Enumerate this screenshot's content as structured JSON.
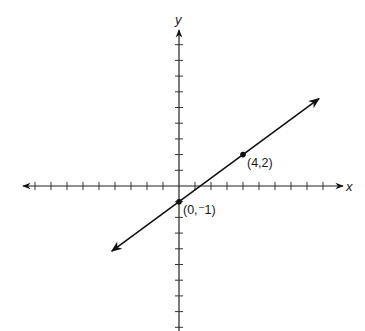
{
  "chart_data": {
    "type": "line",
    "title": "",
    "xlabel": "x",
    "ylabel": "y",
    "xlim": [
      -10,
      10.2
    ],
    "ylim": [
      -9.4,
      9.8
    ],
    "x_ticks": [
      -9,
      -8,
      -7,
      -6,
      -5,
      -4,
      -3,
      -2,
      -1,
      1,
      2,
      3,
      4,
      5,
      6,
      7,
      8,
      9
    ],
    "y_ticks": [
      -9,
      -8,
      -7,
      -6,
      -5,
      -4,
      -3,
      -2,
      -1,
      1,
      2,
      3,
      4,
      5,
      6,
      7,
      8,
      9
    ],
    "tick_labels_shown": false,
    "grid": false,
    "series": [
      {
        "name": "line",
        "equation": "y = 0.75x - 1",
        "slope": 0.75,
        "intercept": -1,
        "x_range": [
          -4.2,
          8.75
        ],
        "arrows_both_ends": true,
        "color": "#111111"
      }
    ],
    "points": [
      {
        "x": 0,
        "y": -1,
        "label": "(0,⁻1)"
      },
      {
        "x": 4,
        "y": 2,
        "label": "(4,2)"
      }
    ]
  }
}
